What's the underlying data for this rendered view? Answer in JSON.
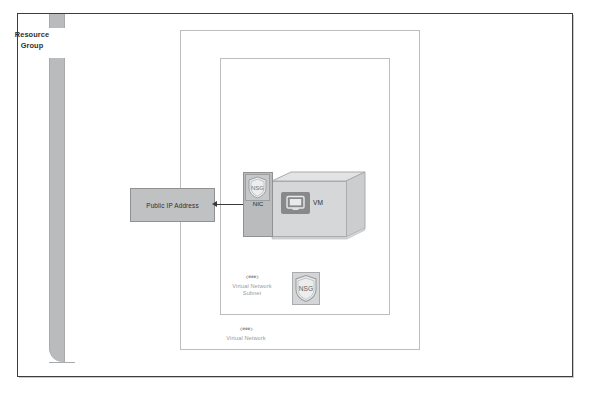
{
  "diagram": {
    "resource_group": {
      "label_line1": "Resource",
      "label_line2": "Group",
      "name": "resource-group-boundary"
    },
    "virtual_network": {
      "caption": "Virtual Network",
      "icon": "vnet-icon",
      "icon_glyph": "‹•••›"
    },
    "subnet": {
      "caption_line1": "Virtual Network",
      "caption_line2": "Subnet",
      "icon": "subnet-icon",
      "icon_glyph": "‹•••›"
    },
    "public_ip": {
      "label": "Public IP Address"
    },
    "nic": {
      "label": "NIC",
      "badge_label": "NSG"
    },
    "vm": {
      "label": "VM",
      "icon": "monitor-icon"
    },
    "nsg": {
      "label": "NSG",
      "icon": "shield-icon"
    },
    "connector": {
      "name": "public-ip-to-nic-arrow",
      "type": "double-headed-arrow"
    }
  },
  "colors": {
    "frame_border": "#3d3d3d",
    "box_border": "#bdbdbd",
    "resource_bar": "#b9bbbd",
    "public_ip_fill": "#bfc1c3",
    "nic_fill": "#b9bbbd",
    "vm_face_fill": "#d6d7d9",
    "vm_side_fill": "#c9cbcd",
    "vm_icon_fill": "#87898b",
    "nsg_fill": "#d3d5d7",
    "caption_text": "#9a9a9a",
    "label_text": "#2e2e2e"
  }
}
